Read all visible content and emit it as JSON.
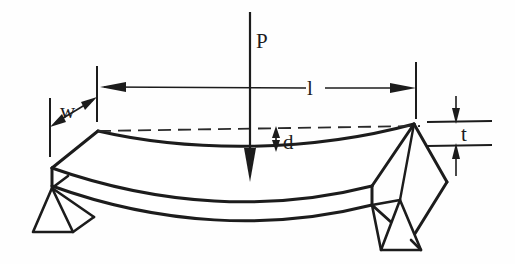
{
  "figure": {
    "background_color": "#fefefe",
    "line_color": "#1c1c1c"
  },
  "labels": {
    "load": "P",
    "span": "l",
    "deflection": "d",
    "width": "w",
    "thickness": "t"
  },
  "annotations": [
    {
      "name": "load-arrow",
      "symbol": "P",
      "meaning": "applied midspan load",
      "direction": "downward",
      "x": 250,
      "y_start": 12,
      "y_tip": 180,
      "label_x": 256,
      "label_y": 48
    },
    {
      "name": "span-dimension",
      "symbol": "l",
      "meaning": "support span length",
      "direction": "horizontal double arrow",
      "y": 87,
      "x_left": 100,
      "x_right": 416,
      "label_x": 312,
      "label_y": 94
    },
    {
      "name": "deflection-dimension",
      "symbol": "d",
      "meaning": "midspan deflection",
      "direction": "vertical double arrow",
      "x": 276,
      "y_top": 127,
      "y_bottom": 150,
      "label_x": 283,
      "label_y": 148
    },
    {
      "name": "width-dimension",
      "symbol": "w",
      "meaning": "specimen width",
      "direction": "diagonal double arrow",
      "label_x": 62,
      "label_y": 116
    },
    {
      "name": "thickness-dimension",
      "symbol": "t",
      "meaning": "specimen thickness",
      "direction": "vertical double arrow",
      "x": 456,
      "y_top": 100,
      "y_bottom": 170,
      "label_x": 461,
      "label_y": 140
    }
  ],
  "geometry": {
    "beam": {
      "back_top_left": [
        98,
        131
      ],
      "back_top_right": [
        414,
        124
      ],
      "front_top_left": [
        52,
        168
      ],
      "front_top_right": [
        372,
        186
      ],
      "front_bottom_left": [
        52,
        184
      ],
      "front_bottom_right": [
        372,
        205
      ],
      "midspan_sag_px": 22
    },
    "supports": [
      {
        "name": "left-support",
        "apex": [
          52,
          188
        ],
        "base_left": [
          33,
          232
        ],
        "base_right": [
          73,
          232
        ]
      },
      {
        "name": "right-support",
        "apex": [
          400,
          200
        ],
        "base_left": [
          381,
          250
        ],
        "base_right": [
          421,
          250
        ]
      }
    ],
    "reference_dashed_line": {
      "from": [
        98,
        131
      ],
      "to": [
        418,
        126
      ]
    }
  }
}
